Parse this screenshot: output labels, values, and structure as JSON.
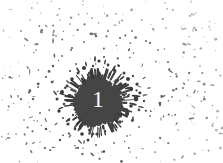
{
  "canvas": {
    "width": 223,
    "height": 163,
    "background_color": "#ffffff"
  },
  "artwork": {
    "name": "ink-splatter-badge",
    "description": "Dark ink splatter blot with a numeral",
    "ink_color": "#454545",
    "ink_color_dark": "#3a3a3a",
    "ink_color_mid": "#5a5a5a",
    "ink_color_light": "#8c8c8c",
    "ink_color_faint": "#c0c0c0"
  },
  "blob": {
    "label": "1",
    "label_color": "#ffffff",
    "center_x": 98,
    "center_y": 102,
    "radius": 25,
    "fill_color": "#454545"
  },
  "splatter": {
    "dots": [
      {
        "x": 99,
        "y": 61,
        "r": 1.6,
        "c": "#3a3a3a"
      },
      {
        "x": 104,
        "y": 57,
        "r": 1.0,
        "c": "#4a4a4a"
      },
      {
        "x": 93,
        "y": 66,
        "r": 1.2,
        "c": "#444444"
      },
      {
        "x": 108,
        "y": 65,
        "r": 1.4,
        "c": "#3f3f3f"
      },
      {
        "x": 114,
        "y": 70,
        "r": 1.8,
        "c": "#3a3a3a"
      },
      {
        "x": 119,
        "y": 66,
        "r": 1.1,
        "c": "#555555"
      },
      {
        "x": 124,
        "y": 73,
        "r": 1.5,
        "c": "#3f3f3f"
      },
      {
        "x": 128,
        "y": 79,
        "r": 2.0,
        "c": "#3a3a3a"
      },
      {
        "x": 133,
        "y": 76,
        "r": 1.2,
        "c": "#4e4e4e"
      },
      {
        "x": 137,
        "y": 84,
        "r": 1.6,
        "c": "#3f3f3f"
      },
      {
        "x": 131,
        "y": 89,
        "r": 2.2,
        "c": "#3a3a3a"
      },
      {
        "x": 140,
        "y": 93,
        "r": 1.4,
        "c": "#454545"
      },
      {
        "x": 136,
        "y": 99,
        "r": 2.4,
        "c": "#3a3a3a"
      },
      {
        "x": 144,
        "y": 101,
        "r": 1.2,
        "c": "#4a4a4a"
      },
      {
        "x": 131,
        "y": 106,
        "r": 1.8,
        "c": "#3f3f3f"
      },
      {
        "x": 139,
        "y": 110,
        "r": 1.3,
        "c": "#4e4e4e"
      },
      {
        "x": 127,
        "y": 114,
        "r": 2.0,
        "c": "#3a3a3a"
      },
      {
        "x": 133,
        "y": 119,
        "r": 1.1,
        "c": "#555555"
      },
      {
        "x": 120,
        "y": 122,
        "r": 1.7,
        "c": "#3f3f3f"
      },
      {
        "x": 112,
        "y": 128,
        "r": 1.9,
        "c": "#3a3a3a"
      },
      {
        "x": 105,
        "y": 131,
        "r": 1.3,
        "c": "#494949"
      },
      {
        "x": 97,
        "y": 134,
        "r": 1.6,
        "c": "#3f3f3f"
      },
      {
        "x": 89,
        "y": 130,
        "r": 1.2,
        "c": "#4e4e4e"
      },
      {
        "x": 82,
        "y": 134,
        "r": 1.8,
        "c": "#3a3a3a"
      },
      {
        "x": 75,
        "y": 129,
        "r": 1.4,
        "c": "#444444"
      },
      {
        "x": 68,
        "y": 124,
        "r": 1.6,
        "c": "#3f3f3f"
      },
      {
        "x": 63,
        "y": 118,
        "r": 1.1,
        "c": "#555555"
      },
      {
        "x": 59,
        "y": 111,
        "r": 1.7,
        "c": "#3a3a3a"
      },
      {
        "x": 64,
        "y": 104,
        "r": 1.3,
        "c": "#4a4a4a"
      },
      {
        "x": 57,
        "y": 99,
        "r": 1.5,
        "c": "#3f3f3f"
      },
      {
        "x": 62,
        "y": 92,
        "r": 2.0,
        "c": "#3a3a3a"
      },
      {
        "x": 67,
        "y": 86,
        "r": 1.4,
        "c": "#464646"
      },
      {
        "x": 72,
        "y": 79,
        "r": 1.8,
        "c": "#3a3a3a"
      },
      {
        "x": 78,
        "y": 73,
        "r": 1.5,
        "c": "#414141"
      },
      {
        "x": 84,
        "y": 68,
        "r": 2.1,
        "c": "#3a3a3a"
      },
      {
        "x": 89,
        "y": 73,
        "r": 1.2,
        "c": "#4d4d4d"
      },
      {
        "x": 76,
        "y": 64,
        "r": 1.0,
        "c": "#5c5c5c"
      },
      {
        "x": 70,
        "y": 71,
        "r": 1.1,
        "c": "#565656"
      },
      {
        "x": 110,
        "y": 74,
        "r": 1.3,
        "c": "#484848"
      },
      {
        "x": 121,
        "y": 85,
        "r": 1.2,
        "c": "#4c4c4c"
      },
      {
        "x": 124,
        "y": 95,
        "r": 1.5,
        "c": "#404040"
      },
      {
        "x": 122,
        "y": 107,
        "r": 1.4,
        "c": "#454545"
      },
      {
        "x": 107,
        "y": 121,
        "r": 1.2,
        "c": "#4b4b4b"
      },
      {
        "x": 90,
        "y": 124,
        "r": 1.3,
        "c": "#454545"
      },
      {
        "x": 73,
        "y": 115,
        "r": 1.2,
        "c": "#4a4a4a"
      },
      {
        "x": 70,
        "y": 95,
        "r": 1.1,
        "c": "#505050"
      },
      {
        "x": 88,
        "y": 140,
        "r": 1.5,
        "c": "#3f3f3f"
      },
      {
        "x": 96,
        "y": 145,
        "r": 1.0,
        "c": "#5a5a5a"
      },
      {
        "x": 60,
        "y": 140,
        "r": 1.2,
        "c": "#595959"
      },
      {
        "x": 46,
        "y": 129,
        "r": 1.3,
        "c": "#4f4f4f"
      },
      {
        "x": 40,
        "y": 113,
        "r": 1.0,
        "c": "#6a6a6a"
      },
      {
        "x": 33,
        "y": 99,
        "r": 1.2,
        "c": "#5c5c5c"
      },
      {
        "x": 38,
        "y": 87,
        "r": 1.0,
        "c": "#6e6e6e"
      },
      {
        "x": 46,
        "y": 77,
        "r": 1.1,
        "c": "#5e5e5e"
      },
      {
        "x": 53,
        "y": 66,
        "r": 1.2,
        "c": "#565656"
      },
      {
        "x": 62,
        "y": 56,
        "r": 1.0,
        "c": "#6d6d6d"
      },
      {
        "x": 72,
        "y": 48,
        "r": 1.1,
        "c": "#5f5f5f"
      },
      {
        "x": 84,
        "y": 42,
        "r": 1.0,
        "c": "#707070"
      },
      {
        "x": 96,
        "y": 36,
        "r": 1.2,
        "c": "#5d5d5d"
      },
      {
        "x": 108,
        "y": 31,
        "r": 1.0,
        "c": "#757575"
      },
      {
        "x": 120,
        "y": 38,
        "r": 1.1,
        "c": "#686868"
      },
      {
        "x": 132,
        "y": 31,
        "r": 1.0,
        "c": "#7a7a7a"
      },
      {
        "x": 146,
        "y": 41,
        "r": 1.1,
        "c": "#6c6c6c"
      },
      {
        "x": 158,
        "y": 50,
        "r": 1.0,
        "c": "#7e7e7e"
      },
      {
        "x": 168,
        "y": 62,
        "r": 1.1,
        "c": "#747474"
      },
      {
        "x": 176,
        "y": 74,
        "r": 1.0,
        "c": "#868686"
      },
      {
        "x": 183,
        "y": 88,
        "r": 1.1,
        "c": "#7c7c7c"
      },
      {
        "x": 172,
        "y": 97,
        "r": 1.0,
        "c": "#8a8a8a"
      },
      {
        "x": 160,
        "y": 105,
        "r": 1.2,
        "c": "#6f6f6f"
      },
      {
        "x": 150,
        "y": 116,
        "r": 1.0,
        "c": "#848484"
      },
      {
        "x": 139,
        "y": 127,
        "r": 1.1,
        "c": "#767676"
      },
      {
        "x": 127,
        "y": 136,
        "r": 1.0,
        "c": "#8b8b8b"
      },
      {
        "x": 114,
        "y": 143,
        "r": 1.1,
        "c": "#7d7d7d"
      },
      {
        "x": 102,
        "y": 152,
        "r": 1.0,
        "c": "#909090"
      },
      {
        "x": 76,
        "y": 148,
        "r": 1.1,
        "c": "#818181"
      },
      {
        "x": 50,
        "y": 150,
        "r": 1.0,
        "c": "#969696"
      },
      {
        "x": 24,
        "y": 120,
        "r": 1.0,
        "c": "#9b9b9b"
      },
      {
        "x": 18,
        "y": 96,
        "r": 1.1,
        "c": "#8d8d8d"
      },
      {
        "x": 12,
        "y": 78,
        "r": 1.0,
        "c": "#a2a2a2"
      },
      {
        "x": 28,
        "y": 68,
        "r": 1.0,
        "c": "#9a9a9a"
      },
      {
        "x": 36,
        "y": 50,
        "r": 1.0,
        "c": "#a6a6a6"
      },
      {
        "x": 56,
        "y": 36,
        "r": 1.0,
        "c": "#9d9d9d"
      },
      {
        "x": 70,
        "y": 24,
        "r": 1.0,
        "c": "#ababab"
      },
      {
        "x": 92,
        "y": 18,
        "r": 1.0,
        "c": "#a3a3a3"
      },
      {
        "x": 116,
        "y": 14,
        "r": 1.0,
        "c": "#b0b0b0"
      },
      {
        "x": 142,
        "y": 20,
        "r": 1.0,
        "c": "#a7a7a7"
      },
      {
        "x": 166,
        "y": 28,
        "r": 1.0,
        "c": "#b4b4b4"
      },
      {
        "x": 188,
        "y": 44,
        "r": 1.0,
        "c": "#acacac"
      },
      {
        "x": 200,
        "y": 66,
        "r": 1.0,
        "c": "#b8b8b8"
      },
      {
        "x": 205,
        "y": 92,
        "r": 1.0,
        "c": "#b0b0b0"
      },
      {
        "x": 194,
        "y": 114,
        "r": 1.0,
        "c": "#bcbcbc"
      },
      {
        "x": 178,
        "y": 130,
        "r": 1.0,
        "c": "#b4b4b4"
      },
      {
        "x": 155,
        "y": 142,
        "r": 1.0,
        "c": "#c0c0c0"
      },
      {
        "x": 130,
        "y": 152,
        "r": 1.0,
        "c": "#b8b8b8"
      },
      {
        "x": 40,
        "y": 142,
        "r": 1.0,
        "c": "#c2c2c2"
      },
      {
        "x": 16,
        "y": 134,
        "r": 1.0,
        "c": "#bebebe"
      },
      {
        "x": 8,
        "y": 110,
        "r": 1.0,
        "c": "#c6c6c6"
      }
    ],
    "streaks": [
      {
        "x": 128,
        "y": 88,
        "w": 7,
        "h": 2.0,
        "rot": -14,
        "c": "#3a3a3a"
      },
      {
        "x": 136,
        "y": 96,
        "w": 9,
        "h": 2.2,
        "rot": 6,
        "c": "#3a3a3a"
      },
      {
        "x": 133,
        "y": 104,
        "w": 8,
        "h": 2.0,
        "rot": 16,
        "c": "#404040"
      },
      {
        "x": 126,
        "y": 112,
        "w": 7,
        "h": 1.8,
        "rot": 28,
        "c": "#3f3f3f"
      },
      {
        "x": 141,
        "y": 107,
        "w": 6,
        "h": 1.6,
        "rot": 12,
        "c": "#4a4a4a"
      },
      {
        "x": 145,
        "y": 95,
        "w": 5,
        "h": 1.5,
        "rot": -4,
        "c": "#4e4e4e"
      },
      {
        "x": 122,
        "y": 78,
        "w": 6,
        "h": 1.8,
        "rot": -38,
        "c": "#3f3f3f"
      },
      {
        "x": 114,
        "y": 68,
        "w": 6,
        "h": 1.8,
        "rot": -60,
        "c": "#3a3a3a"
      },
      {
        "x": 105,
        "y": 62,
        "w": 5,
        "h": 1.6,
        "rot": -74,
        "c": "#444444"
      },
      {
        "x": 95,
        "y": 59,
        "w": 6,
        "h": 1.8,
        "rot": -88,
        "c": "#3a3a3a"
      },
      {
        "x": 86,
        "y": 64,
        "w": 5,
        "h": 1.6,
        "rot": -104,
        "c": "#434343"
      },
      {
        "x": 78,
        "y": 70,
        "w": 6,
        "h": 1.8,
        "rot": -122,
        "c": "#3a3a3a"
      },
      {
        "x": 68,
        "y": 82,
        "w": 5,
        "h": 1.6,
        "rot": -140,
        "c": "#414141"
      },
      {
        "x": 62,
        "y": 94,
        "w": 6,
        "h": 1.8,
        "rot": -166,
        "c": "#3a3a3a"
      },
      {
        "x": 61,
        "y": 108,
        "w": 5,
        "h": 1.6,
        "rot": 160,
        "c": "#444444"
      },
      {
        "x": 68,
        "y": 120,
        "w": 6,
        "h": 1.8,
        "rot": 140,
        "c": "#3a3a3a"
      },
      {
        "x": 79,
        "y": 129,
        "w": 5,
        "h": 1.6,
        "rot": 118,
        "c": "#424242"
      },
      {
        "x": 92,
        "y": 135,
        "w": 6,
        "h": 1.8,
        "rot": 100,
        "c": "#3a3a3a"
      },
      {
        "x": 105,
        "y": 133,
        "w": 5,
        "h": 1.6,
        "rot": 76,
        "c": "#454545"
      },
      {
        "x": 116,
        "y": 126,
        "w": 6,
        "h": 1.8,
        "rot": 56,
        "c": "#3a3a3a"
      },
      {
        "x": 84,
        "y": 142,
        "w": 4,
        "h": 1.4,
        "rot": 96,
        "c": "#525252"
      },
      {
        "x": 70,
        "y": 136,
        "w": 4,
        "h": 1.3,
        "rot": 128,
        "c": "#585858"
      },
      {
        "x": 56,
        "y": 124,
        "w": 4,
        "h": 1.3,
        "rot": 146,
        "c": "#5a5a5a"
      },
      {
        "x": 149,
        "y": 88,
        "w": 4,
        "h": 1.3,
        "rot": -10,
        "c": "#585858"
      },
      {
        "x": 144,
        "y": 78,
        "w": 4,
        "h": 1.3,
        "rot": -30,
        "c": "#5c5c5c"
      }
    ]
  }
}
